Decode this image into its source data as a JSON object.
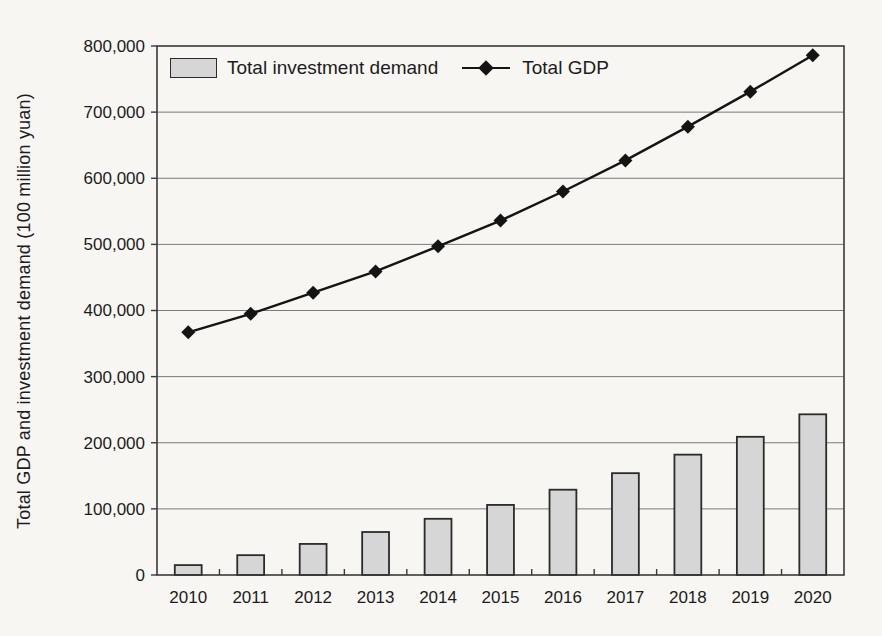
{
  "chart_data": {
    "type": "bar",
    "combo": "bar+line",
    "categories": [
      "2010",
      "2011",
      "2012",
      "2013",
      "2014",
      "2015",
      "2016",
      "2017",
      "2018",
      "2019",
      "2020"
    ],
    "series": [
      {
        "name": "Total investment demand",
        "type": "bar",
        "marker": "none",
        "values": [
          15000,
          30000,
          47000,
          65000,
          85000,
          106000,
          129000,
          154000,
          182000,
          209000,
          243000
        ]
      },
      {
        "name": "Total GDP",
        "type": "line",
        "marker": "diamond",
        "values": [
          367000,
          395000,
          427000,
          459000,
          497000,
          536000,
          580000,
          627000,
          678000,
          731000,
          786000
        ]
      }
    ],
    "title": "",
    "xlabel": "",
    "ylabel": "Total GDP and investment demand (100 million yuan)",
    "ylim": [
      0,
      800000
    ],
    "ytick_step": 100000,
    "ytick_labels": [
      "0",
      "100,000",
      "200,000",
      "300,000",
      "400,000",
      "500,000",
      "600,000",
      "700,000",
      "800,000"
    ],
    "grid": "horizontal",
    "legend_position": "top-left-inside"
  },
  "colors": {
    "background": "#f7f6f3",
    "bar_fill": "#d6d6d6",
    "bar_border": "#2b2b2b",
    "line": "#141414",
    "marker": "#141414",
    "grid": "#7a7a7a",
    "axis": "#3a3a3a",
    "text": "#1c1c1c"
  }
}
